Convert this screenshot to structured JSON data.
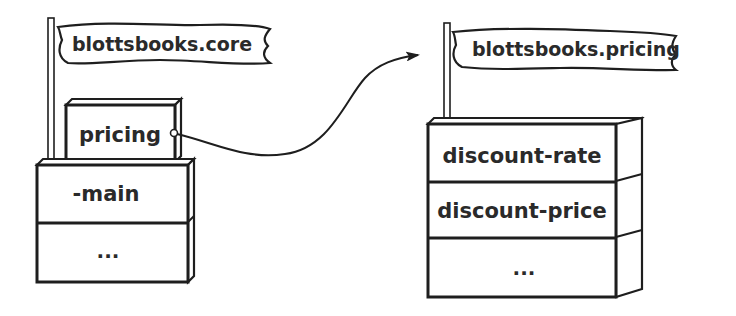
{
  "diagram": {
    "type": "namespace-dependency",
    "colors": {
      "ink": "#1e1e1e",
      "text": "#2a2a2a",
      "background": "#ffffff"
    },
    "namespaces": [
      {
        "id": "core",
        "flag_label": "blottsbooks.core",
        "top_item": "pricing",
        "items": [
          "-main",
          "..."
        ]
      },
      {
        "id": "pricing",
        "flag_label": "blottsbooks.pricing",
        "items": [
          "discount-rate",
          "discount-price",
          "..."
        ]
      }
    ],
    "edges": [
      {
        "from": "core.pricing",
        "to": "blottsbooks.pricing",
        "style": "curved-arrow"
      }
    ]
  }
}
